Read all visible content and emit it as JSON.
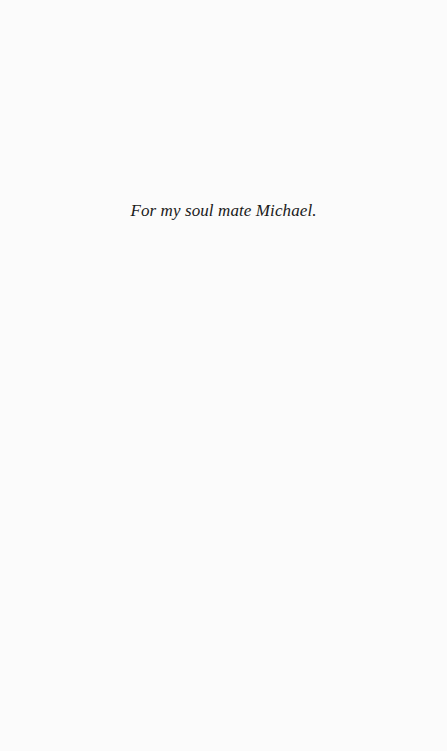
{
  "page": {
    "background_color": "#fbfbfb",
    "dedication": "For my soul mate Michael."
  }
}
